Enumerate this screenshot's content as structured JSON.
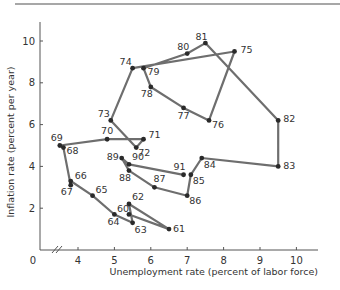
{
  "chart_data": {
    "type": "line",
    "title": "",
    "xlabel": "Unemployment rate (percent of labor force)",
    "ylabel": "Inflation rate (percent per year)",
    "xlim": [
      3.0,
      10.6
    ],
    "ylim": [
      0,
      11
    ],
    "x_ticks": [
      4,
      5,
      6,
      7,
      8,
      9,
      10
    ],
    "y_ticks": [
      2,
      4,
      6,
      8,
      10
    ],
    "origin_label": "0",
    "axis_break": true,
    "grid": false,
    "legend": null,
    "series": [
      {
        "name": "US Phillips curve path 1960-1991",
        "points": [
          {
            "label": "60",
            "x": 5.4,
            "y": 1.7,
            "lx": -12,
            "ly": -2
          },
          {
            "label": "61",
            "x": 6.5,
            "y": 1.0,
            "lx": 4,
            "ly": 3
          },
          {
            "label": "62",
            "x": 5.4,
            "y": 2.2,
            "lx": 3,
            "ly": -4
          },
          {
            "label": "63",
            "x": 5.5,
            "y": 1.3,
            "lx": 2,
            "ly": 10
          },
          {
            "label": "64",
            "x": 5.0,
            "y": 1.7,
            "lx": -7,
            "ly": 11
          },
          {
            "label": "65",
            "x": 4.4,
            "y": 2.6,
            "lx": 3,
            "ly": -3
          },
          {
            "label": "66",
            "x": 3.8,
            "y": 3.3,
            "lx": 4,
            "ly": -2
          },
          {
            "label": "67",
            "x": 3.8,
            "y": 3.1,
            "lx": -10,
            "ly": 10
          },
          {
            "label": "68",
            "x": 3.6,
            "y": 4.9,
            "lx": 3,
            "ly": 6
          },
          {
            "label": "69",
            "x": 3.5,
            "y": 5.0,
            "lx": -9,
            "ly": -5
          },
          {
            "label": "70",
            "x": 4.8,
            "y": 5.3,
            "lx": -6,
            "ly": -5
          },
          {
            "label": "71",
            "x": 5.8,
            "y": 5.3,
            "lx": 5,
            "ly": -1
          },
          {
            "label": "72",
            "x": 5.6,
            "y": 4.9,
            "lx": 2,
            "ly": 8
          },
          {
            "label": "73",
            "x": 4.9,
            "y": 6.2,
            "lx": -13,
            "ly": -3
          },
          {
            "label": "74",
            "x": 5.5,
            "y": 8.7,
            "lx": -13,
            "ly": -3
          },
          {
            "label": "75",
            "x": 8.3,
            "y": 9.5,
            "lx": 6,
            "ly": 2
          },
          {
            "label": "76",
            "x": 7.6,
            "y": 6.2,
            "lx": 3,
            "ly": 8
          },
          {
            "label": "77",
            "x": 6.9,
            "y": 6.8,
            "lx": -6,
            "ly": 11
          },
          {
            "label": "78",
            "x": 6.0,
            "y": 7.8,
            "lx": -10,
            "ly": 10
          },
          {
            "label": "79",
            "x": 5.8,
            "y": 8.7,
            "lx": 4,
            "ly": 7
          },
          {
            "label": "80",
            "x": 7.0,
            "y": 9.4,
            "lx": -10,
            "ly": -4
          },
          {
            "label": "81",
            "x": 7.5,
            "y": 9.9,
            "lx": -10,
            "ly": -3
          },
          {
            "label": "82",
            "x": 9.5,
            "y": 6.2,
            "lx": 5,
            "ly": 2
          },
          {
            "label": "83",
            "x": 9.5,
            "y": 4.0,
            "lx": 5,
            "ly": 3
          },
          {
            "label": "84",
            "x": 7.4,
            "y": 4.4,
            "lx": 2,
            "ly": 10
          },
          {
            "label": "85",
            "x": 7.1,
            "y": 3.6,
            "lx": 2,
            "ly": 9
          },
          {
            "label": "86",
            "x": 7.0,
            "y": 2.6,
            "lx": 2,
            "ly": 8
          },
          {
            "label": "87",
            "x": 6.1,
            "y": 3.0,
            "lx": -1,
            "ly": -5
          },
          {
            "label": "88",
            "x": 5.4,
            "y": 3.8,
            "lx": -10,
            "ly": 10
          },
          {
            "label": "89",
            "x": 5.2,
            "y": 4.4,
            "lx": -15,
            "ly": 2
          },
          {
            "label": "90",
            "x": 5.4,
            "y": 4.1,
            "lx": 3,
            "ly": -4
          },
          {
            "label": "91",
            "x": 6.9,
            "y": 3.6,
            "lx": -10,
            "ly": -5
          }
        ]
      }
    ],
    "colors": {
      "line": "#6e6e6e",
      "marker": "#2a2a2a",
      "axis": "#555555",
      "text": "#333333",
      "top_rule": "#8a8a8a"
    }
  }
}
